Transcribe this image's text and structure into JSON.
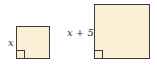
{
  "figure": {
    "shapes": [
      {
        "type": "square",
        "side_label": "x",
        "right_angle_marker": true
      },
      {
        "type": "square",
        "side_label": "x + 5",
        "right_angle_marker": true
      }
    ],
    "colors": {
      "fill": "#fdefd5",
      "stroke": "#3a3a3a"
    }
  },
  "labels": {
    "small_side": "x",
    "large_side": "x + 5"
  }
}
